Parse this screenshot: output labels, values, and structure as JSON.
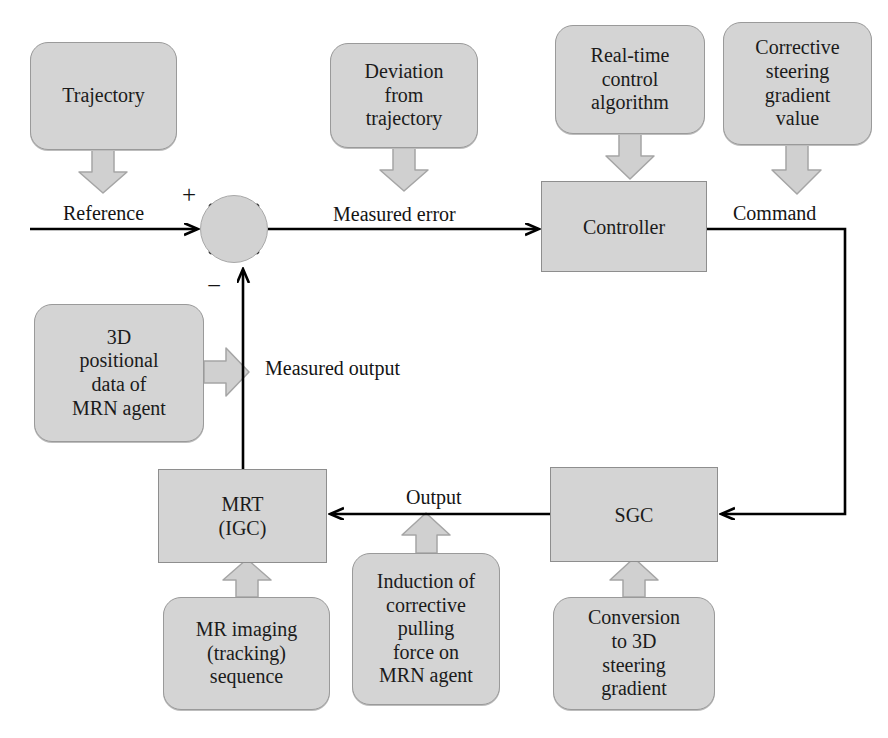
{
  "diagram": {
    "colors": {
      "box_fill": "#d4d4d4",
      "box_border": "#9a9a9a",
      "block_arrow_fill": "#d0d0d0",
      "block_arrow_border": "#a5a5a5",
      "signal_line": "#000000",
      "text": "#141414"
    }
  },
  "source_boxes": {
    "trajectory": "Trajectory",
    "deviation": "Deviation\nfrom\ntrajectory",
    "deviation_lines": [
      "Deviation",
      "from",
      "trajectory"
    ],
    "realtime": "Real-time\ncontrol\nalgorithm",
    "realtime_lines": [
      "Real-time",
      "control",
      "algorithm"
    ],
    "corrective": "Corrective\nsteering\ngradient\nvalue",
    "corrective_lines": [
      "Corrective",
      "steering",
      "gradient",
      "value"
    ],
    "positional_lines": [
      "3D",
      "positional",
      "data of",
      "MRN agent"
    ],
    "mr_imaging_lines": [
      "MR imaging",
      "(tracking)",
      "sequence"
    ],
    "induction_lines": [
      "Induction of",
      "corrective",
      "pulling",
      "force on",
      "MRN agent"
    ],
    "conversion_lines": [
      "Conversion",
      "to 3D",
      "steering",
      "gradient"
    ]
  },
  "process_blocks": {
    "controller": "Controller",
    "mrt_line1": "MRT",
    "mrt_line2": "(IGC)",
    "sgc": "SGC"
  },
  "signal_labels": {
    "reference": "Reference",
    "measured_error": "Measured error",
    "command": "Command",
    "measured_output": "Measured output",
    "output": "Output"
  },
  "summing_junction": {
    "plus": "+",
    "minus": "−"
  }
}
